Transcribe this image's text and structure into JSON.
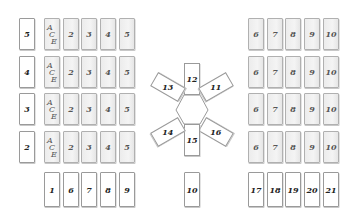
{
  "left_tableau": {
    "row_labels": [
      "5",
      "4",
      "3",
      "2"
    ],
    "ace_label": [
      "A",
      "C",
      "E"
    ],
    "rows": [
      [
        "2",
        "3",
        "4",
        "5"
      ],
      [
        "2",
        "3",
        "4",
        "5"
      ],
      [
        "2",
        "3",
        "4",
        "5"
      ],
      [
        "2",
        "3",
        "4",
        "5"
      ]
    ],
    "bottom_row": [
      "1",
      "6",
      "7",
      "8",
      "9"
    ]
  },
  "right_tableau": {
    "rows": [
      [
        "6",
        "7",
        "8",
        "9",
        "10"
      ],
      [
        "6",
        "7",
        "8",
        "9",
        "10"
      ],
      [
        "6",
        "7",
        "8",
        "9",
        "10"
      ],
      [
        "6",
        "7",
        "8",
        "9",
        "10"
      ]
    ],
    "bottom_row": [
      "17",
      "18",
      "19",
      "20",
      "21"
    ]
  },
  "center_star": {
    "top": "12",
    "upper_right": "11",
    "lower_right": "16",
    "bottom": "15",
    "lower_left": "14",
    "upper_left": "13"
  },
  "center_bottom_card": "10",
  "colors": {
    "background": "#ffffff",
    "card_white": "#ffffff",
    "card_gray": "#ececec",
    "card_border": "#9a9a9a",
    "card_text": "#222222"
  }
}
